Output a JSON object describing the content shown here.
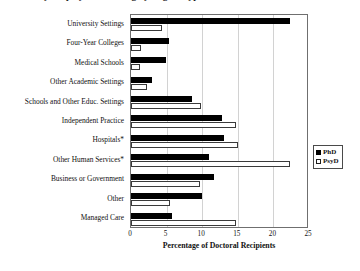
{
  "chart_data": {
    "type": "bar",
    "orientation": "horizontal",
    "title": "Primary Employment Setting by Degree Type",
    "xlabel": "Percentage of Doctoral Recipients",
    "ylabel": "",
    "xlim": [
      0,
      25
    ],
    "xticks": [
      0,
      5,
      10,
      15,
      20,
      25
    ],
    "grid": "vertical",
    "legend_position": "right",
    "categories": [
      "University Settings",
      "Four-Year Colleges",
      "Medical Schools",
      "Other Academic Settings",
      "Schools and Other Educ. Settings",
      "Independent Practice",
      "Hospitals*",
      "Other Human Services*",
      "Business or Government",
      "Other",
      "Managed Care"
    ],
    "series": [
      {
        "name": "PhD",
        "color": "#000000",
        "values": [
          22.3,
          5.3,
          4.9,
          2.9,
          8.5,
          12.8,
          13.0,
          11.0,
          11.7,
          10.0,
          5.7
        ]
      },
      {
        "name": "PsyD",
        "color": "#ffffff",
        "values": [
          4.4,
          1.4,
          1.2,
          2.2,
          9.8,
          14.7,
          15.0,
          22.3,
          9.7,
          5.5,
          14.7
        ]
      }
    ],
    "footnote_marker": "*"
  },
  "legend": {
    "items": [
      {
        "label": "PhD",
        "swatch": "filled-square-icon"
      },
      {
        "label": "PsyD",
        "swatch": "open-square-icon"
      }
    ]
  }
}
